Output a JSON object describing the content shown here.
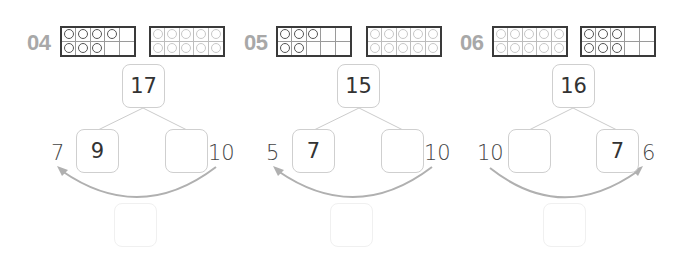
{
  "worksheet": {
    "problems": [
      {
        "number": "04",
        "frame1": {
          "filled": [
            1,
            1,
            1,
            1,
            0,
            1,
            1,
            1,
            0,
            0
          ],
          "style": "dark"
        },
        "frame2": {
          "filled": [
            1,
            1,
            1,
            1,
            1,
            1,
            1,
            1,
            1,
            1
          ],
          "style": "faint"
        },
        "whole": "17",
        "left_part": "9",
        "right_part": "",
        "left_label": "7",
        "right_label": "10",
        "arrow_direction": "right-to-left",
        "answer": ""
      },
      {
        "number": "05",
        "frame1": {
          "filled": [
            1,
            1,
            1,
            0,
            0,
            1,
            1,
            0,
            0,
            0
          ],
          "style": "dark"
        },
        "frame2": {
          "filled": [
            1,
            1,
            1,
            1,
            1,
            1,
            1,
            1,
            1,
            1
          ],
          "style": "faint"
        },
        "whole": "15",
        "left_part": "7",
        "right_part": "",
        "left_label": "5",
        "right_label": "10",
        "arrow_direction": "right-to-left",
        "answer": ""
      },
      {
        "number": "06",
        "frame1": {
          "filled": [
            1,
            1,
            1,
            1,
            1,
            1,
            1,
            1,
            1,
            1
          ],
          "style": "faint"
        },
        "frame2": {
          "filled": [
            1,
            1,
            1,
            0,
            0,
            1,
            1,
            1,
            0,
            0
          ],
          "style": "dark"
        },
        "whole": "16",
        "left_part": "",
        "right_part": "7",
        "left_label": "10",
        "right_label": "6",
        "arrow_direction": "left-to-right",
        "answer": ""
      }
    ]
  },
  "colors": {
    "number_gray": "#a8a8a8",
    "frame_border": "#3a3a3a",
    "box_border": "#cfcfcf",
    "arrow": "#b0b0b0"
  }
}
